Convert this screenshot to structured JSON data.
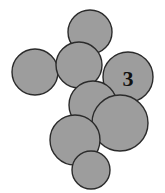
{
  "figure": {
    "width": 165,
    "height": 193,
    "background_color": "#ffffff"
  },
  "style": {
    "circle_fill": "#9d9d9d",
    "circle_stroke": "#2b2b2b",
    "circle_stroke_width": 1.4,
    "label_color": "#111111",
    "label_font_size": 22
  },
  "chart_data": {
    "type": "scatter",
    "title": "",
    "xlabel": "",
    "ylabel": "",
    "xlim": [
      0,
      165
    ],
    "ylim": [
      0,
      193
    ],
    "grid": false,
    "legend": "none",
    "circles": [
      {
        "id": "top-circle",
        "cx": 90,
        "cy": 32,
        "r": 22,
        "label": ""
      },
      {
        "id": "left-circle",
        "cx": 35,
        "cy": 72,
        "r": 23,
        "label": ""
      },
      {
        "id": "upper-mid-circle",
        "cx": 79,
        "cy": 65,
        "r": 23,
        "label": ""
      },
      {
        "id": "labeled-circle",
        "cx": 128,
        "cy": 77,
        "r": 25,
        "label": "3"
      },
      {
        "id": "center-circle",
        "cx": 93,
        "cy": 105,
        "r": 24,
        "label": ""
      },
      {
        "id": "lower-right-circle",
        "cx": 120,
        "cy": 123,
        "r": 28,
        "label": ""
      },
      {
        "id": "lower-left-circle",
        "cx": 75,
        "cy": 140,
        "r": 25,
        "label": ""
      },
      {
        "id": "bottom-circle",
        "cx": 91,
        "cy": 170,
        "r": 19,
        "label": ""
      }
    ]
  },
  "labels": {
    "primary": "3"
  }
}
